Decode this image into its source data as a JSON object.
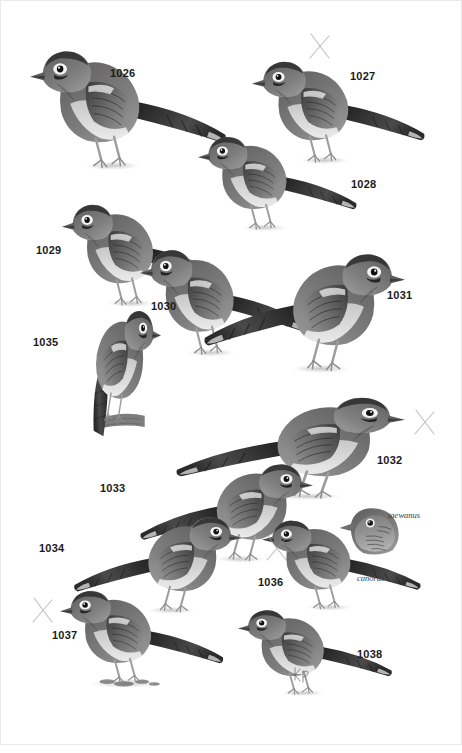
{
  "plate": {
    "kind": "bird-identification-plate",
    "background_color": "#ffffff",
    "ink_color": "#1b1b1b",
    "pencil_color": "#9a9a9a",
    "width": 462,
    "height": 753,
    "signature": "kp"
  },
  "labels": [
    {
      "id": "1026",
      "text": "1026",
      "x": 110,
      "y": 68,
      "subject": "chestnut-crowned-laughingthrush"
    },
    {
      "id": "1027",
      "text": "1027",
      "x": 350,
      "y": 71,
      "subject": "black-faced-laughingthrush"
    },
    {
      "id": "1028",
      "text": "1028",
      "x": 351,
      "y": 179,
      "subject": "spotted-laughingthrush"
    },
    {
      "id": "1029",
      "text": "1029",
      "x": 36,
      "y": 245,
      "subject": "streaked-laughingthrush"
    },
    {
      "id": "1030",
      "text": "1030",
      "x": 151,
      "y": 301,
      "subject": "white-spotted-laughingthrush"
    },
    {
      "id": "1031",
      "text": "1031",
      "x": 387,
      "y": 290,
      "subject": "barred-laughingthrush"
    },
    {
      "id": "1032",
      "text": "1032",
      "x": 377,
      "y": 455,
      "subject": "black-and-white-laughingthrush"
    },
    {
      "id": "1033",
      "text": "1033",
      "x": 100,
      "y": 483,
      "subject": "grey-laughingthrush"
    },
    {
      "id": "1034",
      "text": "1034",
      "x": 39,
      "y": 543,
      "subject": "pale-throated-laughingthrush"
    },
    {
      "id": "1035",
      "text": "1035",
      "x": 33,
      "y": 337,
      "subject": "brown-laughingthrush"
    },
    {
      "id": "1036",
      "text": "1036",
      "x": 258,
      "y": 577,
      "subject": "hwamei"
    },
    {
      "id": "1037",
      "text": "1037",
      "x": 52,
      "y": 630,
      "subject": "white-browed-laughingthrush"
    },
    {
      "id": "1038",
      "text": "1038",
      "x": 357,
      "y": 649,
      "subject": "dark-laughingthrush"
    }
  ],
  "subspecies_labels": [
    {
      "id": "taewanus",
      "text": "taewanus",
      "x": 388,
      "y": 511
    },
    {
      "id": "canorus",
      "text": "canorus",
      "x": 357,
      "y": 574
    }
  ],
  "check_marks": [
    {
      "id": "x-1027",
      "x": 307,
      "y": 31
    },
    {
      "id": "x-1032",
      "x": 412,
      "y": 407
    },
    {
      "id": "x-1036",
      "x": 264,
      "y": 533
    },
    {
      "id": "x-1037",
      "x": 30,
      "y": 595
    }
  ],
  "figures": [
    {
      "id": "1026",
      "name": "bird-figure-1026",
      "x": 30,
      "y": 40,
      "w": 210,
      "h": 145,
      "pose": "standing-left",
      "tail": "long-left"
    },
    {
      "id": "1027",
      "name": "bird-figure-1027",
      "x": 252,
      "y": 52,
      "w": 185,
      "h": 125,
      "pose": "standing-left",
      "tail": "long-right"
    },
    {
      "id": "1028",
      "name": "bird-figure-1028",
      "x": 198,
      "y": 128,
      "w": 170,
      "h": 115,
      "pose": "standing-left",
      "tail": "long-right"
    },
    {
      "id": "1029",
      "name": "bird-figure-1029",
      "x": 62,
      "y": 195,
      "w": 175,
      "h": 125,
      "pose": "standing-left",
      "tail": "long-right"
    },
    {
      "id": "1030",
      "name": "bird-figure-1030",
      "x": 140,
      "y": 240,
      "w": 180,
      "h": 130,
      "pose": "standing-left",
      "tail": "long-right"
    },
    {
      "id": "1031",
      "name": "bird-figure-1031",
      "x": 190,
      "y": 243,
      "w": 215,
      "h": 145,
      "pose": "standing-right",
      "tail": "long-left"
    },
    {
      "id": "1035",
      "name": "bird-figure-1035",
      "x": 36,
      "y": 300,
      "w": 125,
      "h": 140,
      "pose": "perched-on-branch",
      "tail": "down"
    },
    {
      "id": "1032",
      "name": "bird-figure-1032",
      "x": 160,
      "y": 388,
      "w": 245,
      "h": 125,
      "pose": "standing-right",
      "tail": "long-left"
    },
    {
      "id": "1033",
      "name": "bird-figure-1033",
      "x": 128,
      "y": 455,
      "w": 185,
      "h": 120,
      "pose": "standing-right",
      "tail": "long-left"
    },
    {
      "id": "1034",
      "name": "bird-figure-1034",
      "x": 62,
      "y": 508,
      "w": 180,
      "h": 118,
      "pose": "standing-right",
      "tail": "long-left"
    },
    {
      "id": "1036",
      "name": "bird-figure-1036",
      "x": 262,
      "y": 512,
      "w": 170,
      "h": 110,
      "pose": "standing-right",
      "tail": "long-right"
    },
    {
      "id": "1036-head",
      "name": "bird-figure-1036-head-taewanus",
      "x": 338,
      "y": 500,
      "w": 70,
      "h": 60,
      "pose": "head-only",
      "tail": "none"
    },
    {
      "id": "1037",
      "name": "bird-figure-1037",
      "x": 60,
      "y": 582,
      "w": 175,
      "h": 115,
      "pose": "standing-left-on-ground",
      "tail": "long-right"
    },
    {
      "id": "1038",
      "name": "bird-figure-1038",
      "x": 238,
      "y": 602,
      "w": 165,
      "h": 105,
      "pose": "standing-left",
      "tail": "long-right"
    }
  ]
}
